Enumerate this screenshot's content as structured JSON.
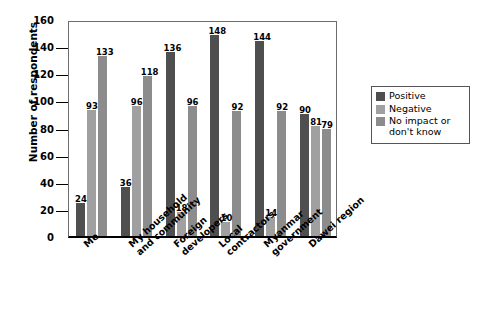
{
  "chart_data": {
    "type": "bar",
    "title": "",
    "xlabel": "",
    "ylabel": "Number of respondents",
    "ylim": [
      0,
      160
    ],
    "ytick_step": 20,
    "yticks": [
      160,
      140,
      120,
      100,
      80,
      60,
      40,
      20,
      0
    ],
    "grid": false,
    "legend_position": "right",
    "categories": [
      "Me",
      "My household\nand community",
      "Foreign\ndevelopers",
      "Local\ncontractors",
      "Myanmar\ngovernment",
      "Dawei region"
    ],
    "series": [
      {
        "name": "Positive",
        "color": "#4f4f4f",
        "values": [
          24,
          36,
          136,
          148,
          144,
          90
        ]
      },
      {
        "name": "Negative",
        "color": "#a0a0a0",
        "values": [
          93,
          96,
          18,
          10,
          14,
          81
        ]
      },
      {
        "name": "No impact or\ndon't know",
        "color": "#8c8c8c",
        "values": [
          133,
          118,
          96,
          92,
          92,
          79
        ]
      }
    ]
  },
  "legend": {
    "items": [
      {
        "label": "Positive",
        "color": "#4f4f4f"
      },
      {
        "label": "Negative",
        "color": "#a0a0a0"
      },
      {
        "label": "No impact or\ndon't know",
        "color": "#8c8c8c"
      }
    ]
  }
}
